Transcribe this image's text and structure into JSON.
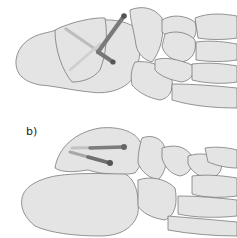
{
  "figure": {
    "panels": [
      {
        "id": "a",
        "label": "",
        "description": "Two crossed screws through the talus/calcaneus region"
      },
      {
        "id": "b",
        "label": "b)",
        "description": "Two parallel screws through the talus into the calcaneus"
      }
    ],
    "colors": {
      "bone_fill": "#e4e4e4",
      "bone_outline": "#6a6a6a",
      "screw_dark": "#6f6f6f",
      "screw_light": "#c9c9c9",
      "background": "#ffffff"
    }
  }
}
